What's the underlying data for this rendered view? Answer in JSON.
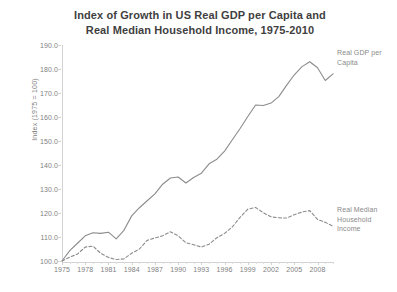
{
  "title": {
    "line1": "Index of Growth in US Real GDP per Capita and",
    "line2": "Real Median Household Income, 1975-2010"
  },
  "axes": {
    "y_title": "Index (1975 = 100)",
    "y_ticks": [
      "100.0",
      "110.0",
      "120.0",
      "130.0",
      "140.0",
      "150.0",
      "160.0",
      "170.0",
      "180.0",
      "190.0"
    ],
    "x_ticks": [
      "1975",
      "1978",
      "1981",
      "1984",
      "1987",
      "1990",
      "1993",
      "1996",
      "1999",
      "2002",
      "2005",
      "2008"
    ]
  },
  "annotations": {
    "gdp": "Real GDP per Capita",
    "income": "Real Median Household Income"
  },
  "colors": {
    "line": "#8c8c8c",
    "axis": "#d2d2d2",
    "text": "#808080",
    "title": "#3f3f3f"
  },
  "chart_data": {
    "type": "line",
    "title": "Index of Growth in US Real GDP per Capita and Real Median Household Income, 1975-2010",
    "xlabel": "",
    "ylabel": "Index (1975 = 100)",
    "ylim": [
      100.0,
      190.0
    ],
    "xlim": [
      1975,
      2010
    ],
    "ytick_step": 10.0,
    "grid": false,
    "legend": "inline annotations at right end of each series",
    "x": [
      1975,
      1976,
      1977,
      1978,
      1979,
      1980,
      1981,
      1982,
      1983,
      1984,
      1985,
      1986,
      1987,
      1988,
      1989,
      1990,
      1991,
      1992,
      1993,
      1994,
      1995,
      1996,
      1997,
      1998,
      1999,
      2000,
      2001,
      2002,
      2003,
      2004,
      2005,
      2006,
      2007,
      2008,
      2009,
      2010
    ],
    "series": [
      {
        "name": "Real GDP per Capita",
        "style": "solid",
        "values": [
          100.0,
          104.3,
          107.4,
          110.5,
          111.8,
          111.5,
          112.0,
          109.2,
          112.8,
          118.8,
          122.2,
          125.1,
          128.0,
          132.0,
          134.6,
          135.0,
          132.5,
          134.8,
          136.6,
          140.5,
          142.4,
          145.8,
          150.5,
          155.2,
          160.2,
          165.0,
          164.8,
          165.8,
          168.5,
          173.2,
          177.6,
          181.0,
          183.0,
          180.5,
          175.2,
          178.0
        ]
      },
      {
        "name": "Real Median Household Income",
        "style": "dashed",
        "values": [
          100.0,
          101.6,
          102.9,
          105.8,
          106.2,
          103.2,
          101.5,
          100.6,
          100.9,
          103.2,
          105.0,
          108.6,
          109.6,
          110.5,
          112.2,
          110.5,
          107.6,
          106.8,
          105.8,
          107.0,
          109.7,
          111.5,
          114.2,
          118.2,
          121.6,
          122.3,
          120.1,
          118.4,
          118.0,
          117.9,
          119.3,
          120.4,
          121.0,
          117.3,
          116.1,
          114.5
        ]
      }
    ]
  }
}
